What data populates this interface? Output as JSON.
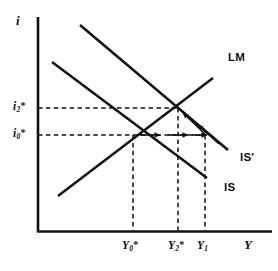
{
  "figure": {
    "type": "is-lm-diagram",
    "axes": {
      "y_axis_label": "i",
      "x_axis_label": "Y",
      "y_ticks": [
        {
          "id": "i2",
          "base": "i",
          "sub": "2",
          "sup": "*",
          "text": "i2*",
          "value_y": 108
        },
        {
          "id": "i0",
          "base": "i",
          "sub": "0",
          "sup": "*",
          "text": "i0*",
          "value_y": 135
        }
      ],
      "x_ticks": [
        {
          "id": "Y0",
          "base": "Y",
          "sub": "0",
          "sup": "*",
          "text": "Y0*",
          "value_x": 133
        },
        {
          "id": "Y2",
          "base": "Y",
          "sub": "2",
          "sup": "*",
          "text": "Y2*",
          "value_x": 178
        },
        {
          "id": "Y1",
          "base": "Y",
          "sub": "1",
          "sup": "",
          "text": "Y1",
          "value_x": 205
        }
      ]
    },
    "curves": [
      {
        "name": "LM",
        "label": "LM",
        "slope": "upward",
        "x1": 58,
        "y1": 196,
        "x2": 213,
        "y2": 78
      },
      {
        "name": "IS-prime",
        "label": "IS'",
        "slope": "downward",
        "x1": 80,
        "y1": 25,
        "x2": 228,
        "y2": 150
      },
      {
        "name": "IS",
        "label": "IS",
        "slope": "downward",
        "x1": 52,
        "y1": 62,
        "x2": 207,
        "y2": 178
      }
    ],
    "curve_label_positions": {
      "LM": {
        "x": 234,
        "y": 58
      },
      "IS-prime": {
        "x": 243,
        "y": 158
      },
      "IS": {
        "x": 228,
        "y": 188
      }
    },
    "equilibria": [
      {
        "id": "E0",
        "label": "initial",
        "x": 133,
        "y": 135
      },
      {
        "id": "E2",
        "label": "new",
        "x": 178,
        "y": 108
      }
    ],
    "guide_lines": {
      "horizontal": [
        {
          "tick": "i2",
          "y": 108,
          "from_x": 38,
          "to_x": 178
        },
        {
          "tick": "i0",
          "y": 135,
          "from_x": 38,
          "to_x": 205
        }
      ],
      "vertical": [
        {
          "tick": "Y0",
          "x": 133,
          "from_y": 135,
          "to_y": 232
        },
        {
          "tick": "Y2",
          "x": 178,
          "from_y": 108,
          "to_y": 232
        },
        {
          "tick": "Y1",
          "x": 205,
          "from_y": 135,
          "to_y": 232
        }
      ]
    },
    "adjustment_arrows": {
      "horizontal_right": [
        {
          "from_x": 140,
          "to_x": 162,
          "y": 135
        },
        {
          "from_x": 166,
          "to_x": 188,
          "y": 135
        },
        {
          "from_x": 190,
          "to_x": 206,
          "y": 135
        }
      ],
      "diagonal_up_left": [
        {
          "from_x": 206,
          "from_y": 135,
          "to_x": 182,
          "to_y": 112
        },
        {
          "from_x": 216,
          "from_y": 142,
          "to_x": 196,
          "to_y": 124
        }
      ]
    },
    "colors": {
      "ink": "#111111",
      "background": "#ffffff",
      "dash": "#111111"
    }
  }
}
